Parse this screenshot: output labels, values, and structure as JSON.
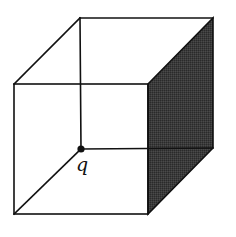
{
  "diagram": {
    "type": "wireframe-cube",
    "colors": {
      "background": "#ffffff",
      "stroke": "#111111",
      "shaded_face": "#3a3a3a",
      "point": "#111111"
    },
    "vertices": {
      "front_top_left": [
        14,
        84
      ],
      "front_top_right": [
        148,
        84
      ],
      "front_bottom_right": [
        148,
        214
      ],
      "front_bottom_left": [
        14,
        214
      ],
      "back_top_left": [
        80,
        18
      ],
      "back_top_right": [
        213,
        18
      ],
      "back_bottom_right": [
        213,
        148
      ],
      "back_bottom_left": [
        81,
        149
      ]
    },
    "shaded_face": "right",
    "point": {
      "label": "q",
      "vertex": "back_bottom_left",
      "x": 81,
      "y": 149,
      "radius": 3.6
    }
  }
}
